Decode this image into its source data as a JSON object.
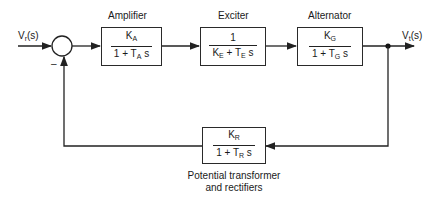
{
  "diagram": {
    "input_signal": {
      "symbol": "V",
      "sub": "r",
      "arg": "(s)"
    },
    "output_signal": {
      "symbol": "V",
      "sub": "t",
      "arg": "(s)"
    },
    "summing_junction": {
      "feedback_sign": "–"
    },
    "blocks": [
      {
        "name": "Amplifier",
        "num": {
          "t": "K",
          "s": "A"
        },
        "den": {
          "a": "1 + T",
          "s": "A",
          "b": " s"
        }
      },
      {
        "name": "Exciter",
        "num": {
          "t": "1",
          "s": ""
        },
        "den": {
          "a": "K",
          "s": "E",
          "b": " + T",
          "s2": "E",
          "c": " s"
        }
      },
      {
        "name": "Alternator",
        "num": {
          "t": "K",
          "s": "G"
        },
        "den": {
          "a": "1 + T",
          "s": "G",
          "b": " s"
        }
      }
    ],
    "feedback_block": {
      "name_line1": "Potential transformer",
      "name_line2": "and rectifiers",
      "num": {
        "t": "K",
        "s": "R"
      },
      "den": {
        "a": "1 + T",
        "s": "R",
        "b": " s"
      }
    },
    "line_color": "#2a2a2a"
  }
}
